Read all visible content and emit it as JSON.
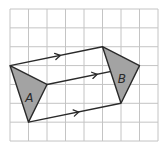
{
  "diagram": {
    "type": "translation-on-grid",
    "grid": {
      "columns": 8,
      "rows": 7,
      "origin_px": [
        10,
        9
      ],
      "cell_w": 18.5,
      "cell_h": 18.86
    },
    "colors": {
      "grid": "#c4c4c4",
      "shape_fill": "#a3a3a3",
      "stroke": "#2a2a2a"
    },
    "shapes": [
      {
        "label": "A",
        "vertices": [
          [
            0,
            3
          ],
          [
            2,
            4
          ],
          [
            1,
            6
          ]
        ],
        "label_pos": [
          1.05,
          4.75
        ]
      },
      {
        "label": "B",
        "vertices": [
          [
            5,
            2
          ],
          [
            7,
            3
          ],
          [
            6,
            5
          ]
        ],
        "label_pos": [
          6.05,
          3.75
        ]
      }
    ],
    "vectors": [
      {
        "from": [
          0,
          3
        ],
        "to": [
          5,
          2
        ]
      },
      {
        "from": [
          2,
          4
        ],
        "to": [
          7,
          3
        ]
      },
      {
        "from": [
          1,
          6
        ],
        "to": [
          6,
          5
        ]
      }
    ],
    "translation": [
      5,
      -1
    ]
  }
}
